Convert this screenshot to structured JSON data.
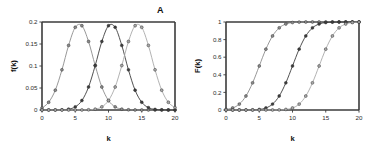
{
  "figure": {
    "background": "#ffffff",
    "panels": [
      {
        "label": "A",
        "name": "panel-a"
      },
      {
        "label": "B",
        "name": "panel-b"
      }
    ]
  },
  "chart_data": [
    {
      "type": "line",
      "panel": "A",
      "title": "",
      "xlabel": "k",
      "ylabel": "f(k)",
      "xlim": [
        0,
        20
      ],
      "ylim": [
        0,
        0.2
      ],
      "xticks": [
        "0",
        "5",
        "10",
        "15",
        "20"
      ],
      "xtick_values": [
        0,
        5,
        10,
        15,
        20
      ],
      "yticks": [
        "0",
        "0.05",
        "0.1",
        "0.15",
        "0.2"
      ],
      "ytick_values": [
        0,
        0.05,
        0.1,
        0.15,
        0.2
      ],
      "grid": false,
      "legend": "none",
      "marker": "circle",
      "x": [
        0,
        1,
        2,
        3,
        4,
        5,
        6,
        7,
        8,
        9,
        10,
        11,
        12,
        13,
        14,
        15,
        16,
        17,
        18,
        19,
        20
      ],
      "series": [
        {
          "name": "f1",
          "color": "#8c8c8c",
          "peak_k": 6,
          "peak_value": 0.2,
          "values": [
            0.0044,
            0.0175,
            0.045,
            0.0913,
            0.1468,
            0.1879,
            0.1915,
            0.1557,
            0.101,
            0.0522,
            0.0215,
            0.0071,
            0.0019,
            0.0004,
            0.0001,
            0.0,
            0.0,
            0.0,
            0.0,
            0.0,
            0.0
          ]
        },
        {
          "name": "f2",
          "color": "#3d3d3d",
          "peak_k": 10,
          "peak_value": 0.2,
          "values": [
            0.0,
            0.0,
            0.0001,
            0.0004,
            0.0019,
            0.0071,
            0.0215,
            0.0522,
            0.101,
            0.1557,
            0.1915,
            0.1879,
            0.1468,
            0.0913,
            0.045,
            0.0175,
            0.0054,
            0.0013,
            0.0003,
            0.0,
            0.0
          ]
        },
        {
          "name": "f3",
          "color": "#a9a9a9",
          "peak_k": 14,
          "peak_value": 0.2,
          "values": [
            0.0,
            0.0,
            0.0,
            0.0,
            0.0,
            0.0,
            0.0001,
            0.0004,
            0.0019,
            0.0071,
            0.0215,
            0.0522,
            0.101,
            0.1557,
            0.1915,
            0.1879,
            0.1468,
            0.0913,
            0.045,
            0.0175,
            0.0054
          ]
        }
      ]
    },
    {
      "type": "line",
      "panel": "B",
      "title": "",
      "xlabel": "k",
      "ylabel": "F(k)",
      "xlim": [
        0,
        20
      ],
      "ylim": [
        0,
        1
      ],
      "xticks": [
        "0",
        "5",
        "10",
        "15",
        "20"
      ],
      "xtick_values": [
        0,
        5,
        10,
        15,
        20
      ],
      "yticks": [
        "0",
        "0.2",
        "0.4",
        "0.6",
        "0.8",
        "1"
      ],
      "ytick_values": [
        0,
        0.2,
        0.4,
        0.6,
        0.8,
        1.0
      ],
      "grid": false,
      "legend": "none",
      "marker": "circle",
      "x": [
        0,
        1,
        2,
        3,
        4,
        5,
        6,
        7,
        8,
        9,
        10,
        11,
        12,
        13,
        14,
        15,
        16,
        17,
        18,
        19,
        20
      ],
      "series": [
        {
          "name": "F1",
          "color": "#8c8c8c",
          "midpoint_k": 6,
          "values": [
            0.0062,
            0.0228,
            0.0668,
            0.1587,
            0.3085,
            0.5,
            0.6915,
            0.8413,
            0.9332,
            0.9772,
            0.9938,
            0.9987,
            0.9998,
            1.0,
            1.0,
            1.0,
            1.0,
            1.0,
            1.0,
            1.0,
            1.0
          ]
        },
        {
          "name": "F2",
          "color": "#3d3d3d",
          "midpoint_k": 10,
          "values": [
            0.0,
            0.0,
            0.0001,
            0.0003,
            0.0013,
            0.0062,
            0.0228,
            0.0668,
            0.1587,
            0.3085,
            0.5,
            0.6915,
            0.8413,
            0.9332,
            0.9772,
            0.9938,
            0.9987,
            0.9998,
            1.0,
            1.0,
            1.0
          ]
        },
        {
          "name": "F3",
          "color": "#a9a9a9",
          "midpoint_k": 14,
          "values": [
            0.0,
            0.0,
            0.0,
            0.0,
            0.0,
            0.0,
            0.0,
            0.0003,
            0.0013,
            0.0062,
            0.0228,
            0.0668,
            0.1587,
            0.3085,
            0.5,
            0.6915,
            0.8413,
            0.9332,
            0.9772,
            0.9938,
            0.9987
          ]
        }
      ]
    }
  ]
}
